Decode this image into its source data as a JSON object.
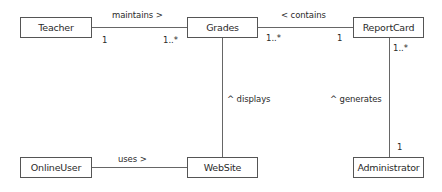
{
  "classes": {
    "teacher": "Teacher",
    "grades": "Grades",
    "report_card": "ReportCard",
    "online_user": "OnlineUser",
    "website": "WebSite",
    "administrator": "Administrator"
  },
  "associations": {
    "teacher_grades": {
      "label": "maintains >",
      "mult_source": "1",
      "mult_target": "1..*"
    },
    "grades_reportcard": {
      "label": "< contains",
      "mult_source": "1..*",
      "mult_target": "1"
    },
    "grades_website": {
      "label": "^ displays"
    },
    "reportcard_administrator": {
      "label": "^ generates",
      "mult_source": "1..*",
      "mult_target": "1"
    },
    "onlineuser_website": {
      "label": "uses >"
    }
  }
}
